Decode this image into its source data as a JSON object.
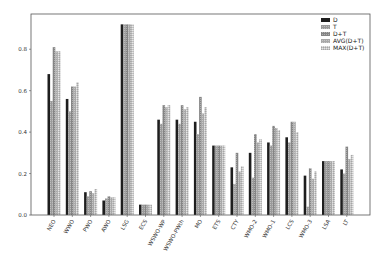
{
  "chart_data": {
    "type": "bar",
    "title": "",
    "xlabel": "",
    "ylabel": "",
    "ylim": [
      0,
      0.97
    ],
    "yticks": [
      "0.0",
      "0.2",
      "0.4",
      "0.6",
      "0.8"
    ],
    "grid": false,
    "legend_position": "upper right",
    "categories": [
      "NEO",
      "WWO",
      "PWO",
      "AWO",
      "LSG",
      "ECS",
      "WSWO-WP",
      "WSWO-PWth",
      "MO",
      "ETS",
      "CTY",
      "WMO-2",
      "WMO-1",
      "LCS",
      "WMO-3",
      "LSA",
      "LT"
    ],
    "series": [
      {
        "name": "D",
        "color": "#1e1e1e",
        "pattern": "solid",
        "values": [
          0.68,
          0.56,
          0.11,
          0.07,
          0.92,
          0.05,
          0.46,
          0.46,
          0.45,
          0.335,
          0.23,
          0.3,
          0.35,
          0.375,
          0.19,
          0.26,
          0.22
        ]
      },
      {
        "name": "T",
        "color": "#9a9a9a",
        "pattern": "stipple",
        "values": [
          0.55,
          0.5,
          0.09,
          0.08,
          0.92,
          0.05,
          0.44,
          0.44,
          0.39,
          0.335,
          0.15,
          0.18,
          0.335,
          0.35,
          0.04,
          0.26,
          0.2
        ]
      },
      {
        "name": "D+T",
        "color": "#858585",
        "pattern": "stipple",
        "values": [
          0.81,
          0.62,
          0.115,
          0.09,
          0.92,
          0.05,
          0.53,
          0.53,
          0.57,
          0.335,
          0.3,
          0.39,
          0.43,
          0.45,
          0.225,
          0.26,
          0.33
        ]
      },
      {
        "name": "AVG(D+T)",
        "color": "#a8a8a8",
        "pattern": "stipple",
        "values": [
          0.79,
          0.62,
          0.105,
          0.085,
          0.92,
          0.05,
          0.52,
          0.51,
          0.49,
          0.335,
          0.21,
          0.35,
          0.42,
          0.45,
          0.175,
          0.26,
          0.27
        ]
      },
      {
        "name": "MAX(D+T)",
        "color": "#c4c4c4",
        "pattern": "hatch",
        "values": [
          0.79,
          0.64,
          0.125,
          0.085,
          0.92,
          0.05,
          0.53,
          0.52,
          0.52,
          0.335,
          0.235,
          0.365,
          0.41,
          0.4,
          0.21,
          0.26,
          0.29
        ]
      }
    ]
  }
}
